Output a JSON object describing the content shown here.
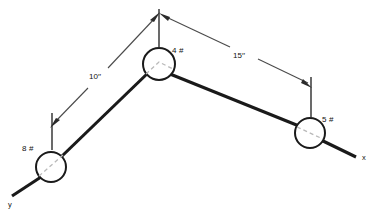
{
  "diagram": {
    "colors": {
      "member": "#1a1a1a",
      "node_stroke": "#1a1a1a",
      "node_fill": "#ffffff",
      "hidden_line": "#b9b9b9",
      "dimension": "#4a4a4a",
      "text": "#111111",
      "background": "#ffffff"
    },
    "axes": [
      {
        "id": "x-axis",
        "label": "x",
        "label_x": 362,
        "label_y": 160
      },
      {
        "id": "y-axis",
        "label": "y",
        "label_x": 8,
        "label_y": 207
      }
    ],
    "nodes": [
      {
        "id": "node-left",
        "label": "8 #",
        "value": 8,
        "unit": "#",
        "cx": 51,
        "cy": 167,
        "r": 15,
        "label_x": 22,
        "label_y": 151
      },
      {
        "id": "node-apex",
        "label": "4 #",
        "value": 4,
        "unit": "#",
        "cx": 159,
        "cy": 64,
        "r": 16,
        "label_x": 172,
        "label_y": 53
      },
      {
        "id": "node-right",
        "label": "5 #",
        "value": 5,
        "unit": "#",
        "cx": 310,
        "cy": 133,
        "r": 15,
        "label_x": 322,
        "label_y": 122
      }
    ],
    "dimensions": [
      {
        "id": "dim-left",
        "label": "10′′",
        "value": 10,
        "unit": "in",
        "from_node": "node-left",
        "to_node": "node-apex",
        "label_x": 96,
        "label_y": 75
      },
      {
        "id": "dim-right",
        "label": "15′′",
        "value": 15,
        "unit": "in",
        "from_node": "node-apex",
        "to_node": "node-right",
        "label_x": 240,
        "label_y": 57
      }
    ]
  }
}
